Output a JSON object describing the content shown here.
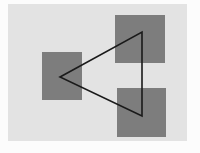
{
  "figure": {
    "name": "geometric-figure-squares-and-triangle",
    "canvas": {
      "width": 200,
      "height": 153,
      "background_color": "#fcfcfc"
    },
    "panel": {
      "label": "plot-panel",
      "x": 8,
      "y": 4,
      "width": 179,
      "height": 137,
      "fill_color": "#e3e3e3",
      "stroke_color": "#e3e3e3"
    },
    "shapes": {
      "square_fill_color": "#7d7d7d",
      "squares": [
        {
          "label": "left-square",
          "position": "left",
          "x": 42,
          "y": 52,
          "width": 40,
          "height": 48
        },
        {
          "label": "top-right-square",
          "position": "top-right",
          "x": 115,
          "y": 15,
          "width": 50,
          "height": 48
        },
        {
          "label": "bottom-right-square",
          "position": "bottom-right",
          "x": 117,
          "y": 88,
          "width": 49,
          "height": 49
        }
      ],
      "triangle": {
        "label": "triangle-outline",
        "stroke_color": "#1a1a1a",
        "fill": "none",
        "stroke_width": 1.6,
        "points": "60,77 142,32 142,116",
        "vertices": [
          {
            "name": "left-vertex",
            "x": 60,
            "y": 77
          },
          {
            "name": "top-right-vertex",
            "x": 142,
            "y": 32
          },
          {
            "name": "bottom-right-vertex",
            "x": 142,
            "y": 116
          }
        ]
      }
    }
  }
}
